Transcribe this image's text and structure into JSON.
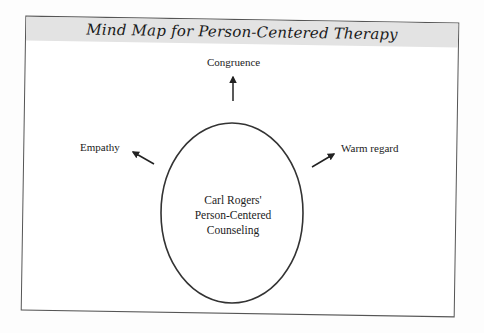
{
  "title": "Mind Map for Person-Centered Therapy",
  "colors": {
    "header_band": "#e3e3e3",
    "frame_border": "#555555",
    "ink": "#222222",
    "background": "#ffffff"
  },
  "central_node": {
    "shape": "ellipse",
    "lines": [
      "Carl Rogers'",
      "Person-Centered",
      "Counseling"
    ]
  },
  "branches": [
    {
      "label": "Congruence",
      "direction": "up",
      "arrow-icon": "arrow-up-icon"
    },
    {
      "label": "Empathy",
      "direction": "upper-left",
      "arrow-icon": "arrow-up-left-icon"
    },
    {
      "label": "Warm regard",
      "direction": "upper-right",
      "arrow-icon": "arrow-up-right-icon"
    }
  ]
}
